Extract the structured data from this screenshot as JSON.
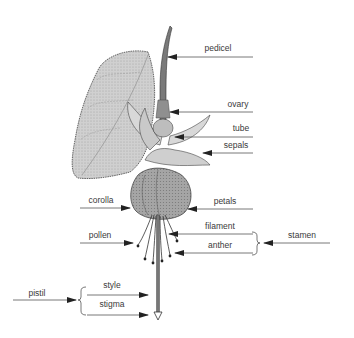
{
  "diagram": {
    "colors": {
      "line": "#555555",
      "text": "#3a3a3a",
      "leaf": "#c9c9c9",
      "petal": "#a8a8a8",
      "sepal": "#d4d4d4"
    },
    "labels": [
      {
        "id": "pedicel",
        "text": "pedicel"
      },
      {
        "id": "ovary",
        "text": "ovary"
      },
      {
        "id": "tube",
        "text": "tube"
      },
      {
        "id": "sepals",
        "text": "sepals"
      },
      {
        "id": "corolla",
        "text": "corolla"
      },
      {
        "id": "petals",
        "text": "petals"
      },
      {
        "id": "pollen",
        "text": "pollen"
      },
      {
        "id": "filament",
        "text": "filament"
      },
      {
        "id": "anther",
        "text": "anther"
      },
      {
        "id": "stamen",
        "text": "stamen"
      },
      {
        "id": "style",
        "text": "style"
      },
      {
        "id": "stigma",
        "text": "stigma"
      },
      {
        "id": "pistil",
        "text": "pistil"
      }
    ],
    "groups": [
      {
        "name": "stamen",
        "members": [
          "filament",
          "anther"
        ]
      },
      {
        "name": "pistil",
        "members": [
          "style",
          "stigma"
        ]
      }
    ]
  }
}
